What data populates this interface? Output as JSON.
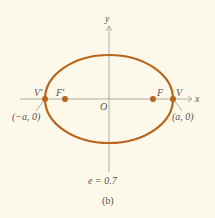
{
  "diagram": {
    "type": "ellipse-conic",
    "colors": {
      "background": "#fcf9ea",
      "ellipse": "#b8651c",
      "axes": "#8a8a8a",
      "text": "#555555"
    },
    "axis_labels": {
      "x": "x",
      "y": "y"
    },
    "origin_label": "O",
    "points": {
      "left_vertex": "V'",
      "right_vertex": "V",
      "left_focus": "F'",
      "right_focus": "F"
    },
    "coordinates": {
      "left": "(−a, 0)",
      "right": "(a, 0)"
    },
    "eccentricity": "e = 0.7",
    "caption": "(b)"
  }
}
